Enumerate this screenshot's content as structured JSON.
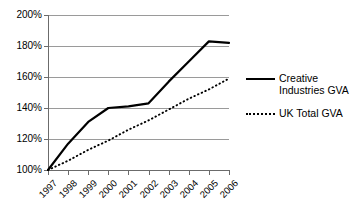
{
  "chart_data": {
    "type": "line",
    "title": "",
    "xlabel": "",
    "ylabel": "",
    "categories": [
      "1997",
      "1998",
      "1999",
      "2000",
      "2001",
      "2002",
      "2003",
      "2004",
      "2005",
      "2006"
    ],
    "series": [
      {
        "name": "Creative Industries GVA",
        "style": "solid",
        "color": "#000000",
        "values": [
          100,
          117,
          131,
          140,
          141,
          143,
          157,
          170,
          183,
          182
        ]
      },
      {
        "name": "UK Total GVA",
        "style": "dotted",
        "color": "#000000",
        "values": [
          100,
          106,
          113,
          119,
          126,
          132,
          139,
          146,
          152,
          159
        ]
      }
    ],
    "ylim": [
      100,
      200
    ],
    "yticks": [
      100,
      120,
      140,
      160,
      180,
      200
    ],
    "ytick_labels": [
      "100%",
      "120%",
      "140%",
      "160%",
      "180%",
      "200%"
    ],
    "grid": true,
    "legend_position": "right"
  },
  "legend": {
    "items": [
      {
        "label": "Creative Industries GVA",
        "style": "solid"
      },
      {
        "label": "UK Total GVA",
        "style": "dotted"
      }
    ]
  },
  "colors": {
    "series": "#000000",
    "gridline": "#9a9a9a",
    "axis": "#6b6b6b",
    "background": "#ffffff"
  }
}
